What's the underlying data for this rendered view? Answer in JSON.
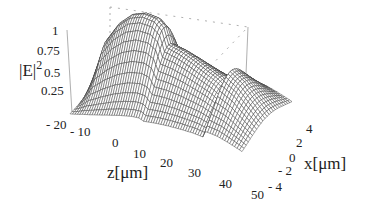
{
  "chart_data": {
    "type": "surface",
    "title": "",
    "zlabel": "|E|²",
    "xlabel": "z[μm]",
    "ylabel": "x[μm]",
    "z_axis_label_base": "|E|",
    "z_axis_label_sup": "2",
    "z_ticks": [
      "1",
      "0.75",
      "0.5",
      "0.25"
    ],
    "z_range": [
      0,
      1
    ],
    "zcoord_ticks": [
      "- 20",
      "- 10",
      "0",
      "10",
      "20",
      "30",
      "40",
      "50"
    ],
    "zcoord_range": [
      -20,
      50
    ],
    "x_ticks": [
      "4",
      "2",
      "0",
      "- 2",
      "- 4"
    ],
    "x_range": [
      -4,
      4
    ],
    "grid": false,
    "style": "wireframe",
    "profile_along_z": {
      "z": [
        -20,
        -15,
        -10,
        -5,
        0,
        5,
        8,
        10,
        15,
        20,
        25,
        30,
        34,
        35,
        40,
        45,
        50
      ],
      "peak_intensity": [
        0.05,
        0.6,
        0.82,
        0.95,
        1.0,
        0.98,
        0.9,
        0.72,
        0.68,
        0.62,
        0.55,
        0.48,
        0.4,
        0.6,
        0.5,
        0.35,
        0.2
      ]
    }
  }
}
